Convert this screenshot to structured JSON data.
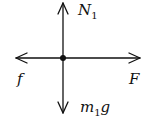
{
  "diagram": {
    "type": "free-body-diagram",
    "forces": [
      {
        "id": "normal",
        "label": "N",
        "subscript": "1",
        "direction": "up"
      },
      {
        "id": "friction",
        "label": "f",
        "subscript": "",
        "direction": "left"
      },
      {
        "id": "applied",
        "label": "F",
        "subscript": "",
        "direction": "right"
      },
      {
        "id": "weight",
        "label": "m",
        "subscript": "1",
        "suffix": "g",
        "direction": "down"
      }
    ],
    "colors": {
      "line": "#111111",
      "background": "#ffffff"
    }
  }
}
